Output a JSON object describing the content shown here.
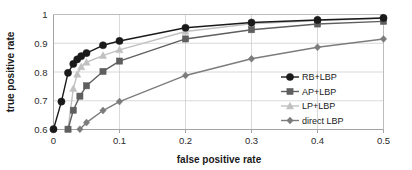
{
  "chart_data": {
    "type": "line",
    "title": "",
    "xlabel": "false positive rate",
    "ylabel": "true positive rate",
    "xlim": [
      0,
      0.5
    ],
    "ylim": [
      0.6,
      1.0
    ],
    "xticks": [
      0,
      0.1,
      0.2,
      0.3,
      0.4,
      0.5
    ],
    "xtick_labels": [
      "0",
      "0.1",
      "0.2",
      "0.3",
      "0.4",
      "0.5"
    ],
    "yticks": [
      0.6,
      0.7,
      0.8,
      0.9,
      1.0
    ],
    "ytick_labels": [
      "0.6",
      "0.7",
      "0.8",
      "0.9",
      "1"
    ],
    "grid": "horizontal-and-vertical",
    "legend_position": "inside-lower-right",
    "series": [
      {
        "name": "RB+LBP",
        "color": "#1a1a1a",
        "marker": "circle",
        "x": [
          0.0,
          0.012,
          0.022,
          0.03,
          0.036,
          0.042,
          0.05,
          0.075,
          0.1,
          0.2,
          0.3,
          0.4,
          0.5
        ],
        "y": [
          0.601,
          0.697,
          0.797,
          0.828,
          0.844,
          0.855,
          0.866,
          0.893,
          0.908,
          0.954,
          0.972,
          0.981,
          0.988
        ]
      },
      {
        "name": "AP+LBP",
        "color": "#5f5f5f",
        "marker": "square",
        "x": [
          0.022,
          0.03,
          0.04,
          0.05,
          0.075,
          0.1,
          0.2,
          0.3,
          0.4,
          0.5
        ],
        "y": [
          0.601,
          0.667,
          0.716,
          0.752,
          0.802,
          0.838,
          0.915,
          0.947,
          0.967,
          0.976
        ]
      },
      {
        "name": "LP+LBP",
        "color": "#c0c0c0",
        "marker": "triangle",
        "x": [
          0.022,
          0.03,
          0.036,
          0.042,
          0.05,
          0.075,
          0.1,
          0.2,
          0.3,
          0.4,
          0.5
        ],
        "y": [
          0.601,
          0.742,
          0.792,
          0.818,
          0.834,
          0.857,
          0.877,
          0.941,
          0.968,
          0.979,
          0.987
        ]
      },
      {
        "name": "direct LBP",
        "color": "#7c7c7c",
        "marker": "diamond",
        "x": [
          0.04,
          0.05,
          0.075,
          0.1,
          0.2,
          0.3,
          0.4,
          0.5
        ],
        "y": [
          0.601,
          0.624,
          0.666,
          0.697,
          0.788,
          0.846,
          0.886,
          0.915
        ]
      }
    ]
  },
  "legend": {
    "items": [
      {
        "label": "RB+LBP"
      },
      {
        "label": "AP+LBP"
      },
      {
        "label": "LP+LBP"
      },
      {
        "label": "direct LBP"
      }
    ]
  }
}
